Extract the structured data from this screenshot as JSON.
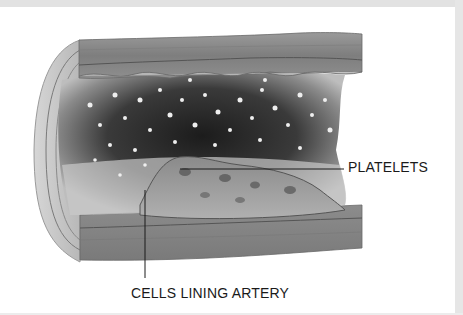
{
  "figure": {
    "colors": {
      "background": "#ffffff",
      "border_strip": "#e2e2e2",
      "wall": "#8a8a8a",
      "lumen": "#2a2a2a",
      "plaque": "#9a9a9a",
      "label_text": "#1a1a1a"
    }
  },
  "labels": {
    "platelets": "PLATELETS",
    "cells_lining_artery": "CELLS LINING ARTERY"
  }
}
